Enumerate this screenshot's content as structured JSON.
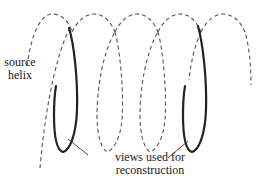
{
  "figure": {
    "source_label": {
      "line1": "source",
      "line2": "helix"
    },
    "views_label": {
      "line1": "views used for",
      "line2": "reconstruction"
    },
    "colors": {
      "dashed_helix": "#555555",
      "solid_views": "#222222",
      "leader_lines": "#333333",
      "text": "#222222",
      "background": "#ffffff"
    },
    "helix": {
      "loops": 5,
      "style": "dashed",
      "highlighted_segments": 2
    }
  }
}
